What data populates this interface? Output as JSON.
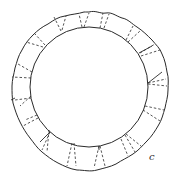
{
  "figure": {
    "panel_label": "c",
    "stroke_color": "#2a2a2a",
    "background": "#ffffff"
  }
}
